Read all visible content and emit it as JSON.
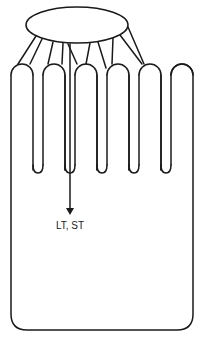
{
  "diagram": {
    "finger_count": 6,
    "connector_count": 8,
    "arrow_label": "LT, ST",
    "colors": {
      "stroke": "#1a1a1a",
      "background": "#ffffff"
    }
  }
}
